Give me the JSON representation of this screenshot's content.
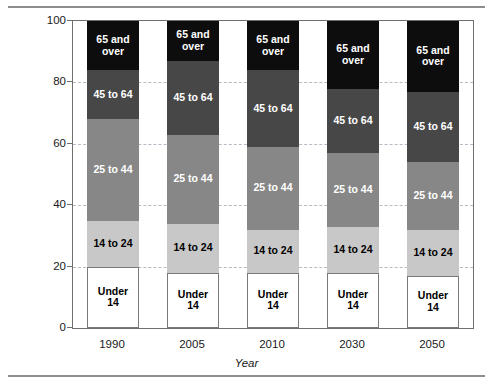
{
  "chart_data": {
    "type": "bar",
    "stacked": true,
    "title": "",
    "xlabel": "Year",
    "ylabel": "Percentage of Population in Age Category",
    "categories": [
      "1990",
      "2005",
      "2010",
      "2030",
      "2050"
    ],
    "ylim": [
      0,
      100
    ],
    "yticks": [
      0,
      20,
      40,
      60,
      80,
      100
    ],
    "ytick_labels": [
      "0",
      "20",
      "40",
      "60",
      "80",
      "100"
    ],
    "grid": true,
    "grid_axis": "y",
    "legend": "none",
    "series": [
      {
        "name": "Under 14",
        "label": "Under\n14",
        "color": "#ffffff",
        "text_color": "#000000",
        "values": [
          20,
          18,
          18,
          18,
          17
        ]
      },
      {
        "name": "14 to 24",
        "label": "14 to 24",
        "color": "#c8c8c8",
        "text_color": "#000000",
        "values": [
          15,
          16,
          14,
          15,
          15
        ]
      },
      {
        "name": "25 to 44",
        "label": "25 to 44",
        "color": "#878787",
        "text_color": "#ffffff",
        "values": [
          33,
          29,
          27,
          24,
          22
        ]
      },
      {
        "name": "45 to 64",
        "label": "45 to 64",
        "color": "#474747",
        "text_color": "#ffffff",
        "values": [
          16,
          24,
          25,
          21,
          23
        ]
      },
      {
        "name": "65 and over",
        "label": "65 and\nover",
        "color": "#0d0d0d",
        "text_color": "#ffffff",
        "values": [
          16,
          13,
          16,
          22,
          23
        ]
      }
    ]
  }
}
